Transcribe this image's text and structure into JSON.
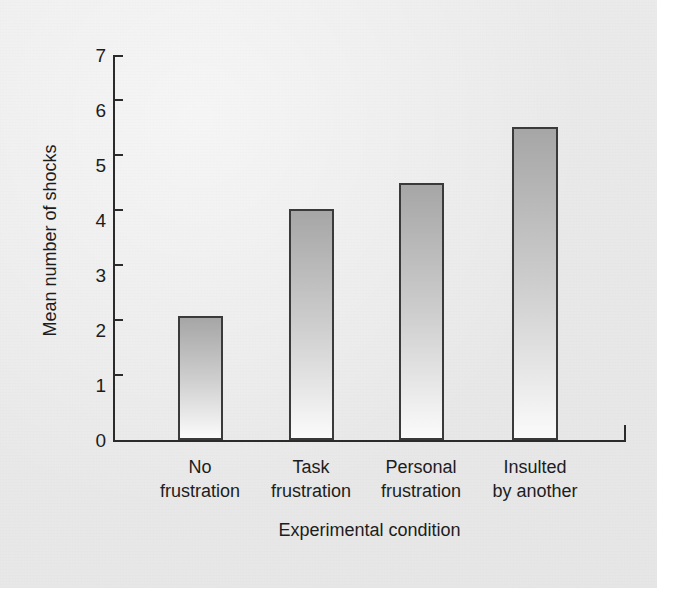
{
  "chart_data": {
    "type": "bar",
    "title": "",
    "xlabel": "Experimental condition",
    "ylabel": "Mean number of shocks",
    "categories": [
      "No\nfrustration",
      "Task\nfrustration",
      "Personal\nfrustration",
      "Insulted\nby another"
    ],
    "category_lines": [
      [
        "No",
        "frustration"
      ],
      [
        "Task",
        "frustration"
      ],
      [
        "Personal",
        "frustration"
      ],
      [
        "Insulted",
        "by another"
      ]
    ],
    "values": [
      2.25,
      4.2,
      4.67,
      5.7
    ],
    "ylim": [
      0,
      7
    ],
    "yticks": [
      7,
      6,
      5,
      4,
      3,
      2,
      1,
      0
    ],
    "ytick_labels": [
      "7",
      "6",
      "5",
      "4",
      "3",
      "2",
      "1",
      "0"
    ],
    "grid": false,
    "legend": false,
    "legend_position": "none",
    "bar_fill_top_color": "#a6a6a6",
    "bar_fill_bottom_color": "#fbfbfb",
    "bar_outline_color": "#3a3a3a",
    "axis_color": "#2b2b2b",
    "background_color": "#e9e9e9",
    "text_color": "#1d1d1d"
  }
}
